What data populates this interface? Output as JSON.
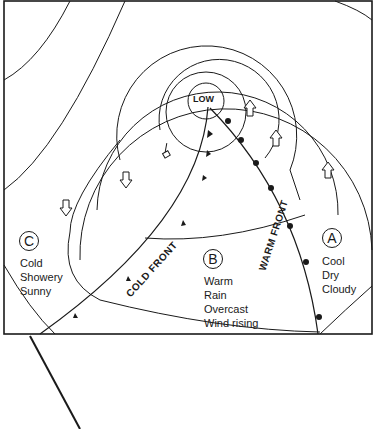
{
  "diagram": {
    "centre_label": "LOW",
    "fronts": {
      "cold": "COLD FRONT",
      "warm": "WARM FRONT"
    },
    "regions": {
      "a": {
        "letter": "A",
        "lines": [
          "Cool",
          "Dry",
          "Cloudy"
        ]
      },
      "b": {
        "letter": "B",
        "lines": [
          "Warm",
          "Rain",
          "Overcast",
          "Wind rising"
        ]
      },
      "c": {
        "letter": "C",
        "lines": [
          "Cold",
          "Showery",
          "Sunny"
        ]
      }
    },
    "colors": {
      "ink": "#1a1a1a",
      "paper": "#ffffff"
    }
  }
}
